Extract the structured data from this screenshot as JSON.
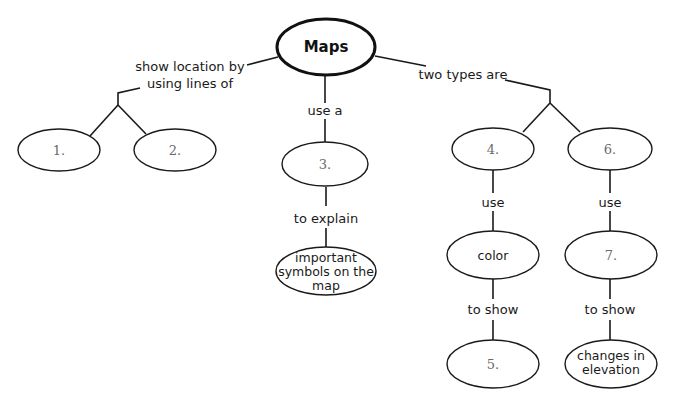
{
  "diagram": {
    "root": {
      "label": "Maps"
    },
    "links": {
      "show_location": {
        "line1": "show location by",
        "line2": "using lines of"
      },
      "use_a": "use a",
      "two_types": "two types are",
      "to_explain": "to explain",
      "use_left": "use",
      "use_right": "use",
      "to_show_left": "to show",
      "to_show_right": "to show"
    },
    "nodes": {
      "n1": "1.",
      "n2": "2.",
      "n3": "3.",
      "symbols": {
        "line1": "important",
        "line2": "symbols on the",
        "line3": "map"
      },
      "n4": "4.",
      "n6": "6.",
      "color": "color",
      "n7": "7.",
      "n5": "5.",
      "elevation": {
        "line1": "changes in",
        "line2": "elevation"
      }
    }
  }
}
